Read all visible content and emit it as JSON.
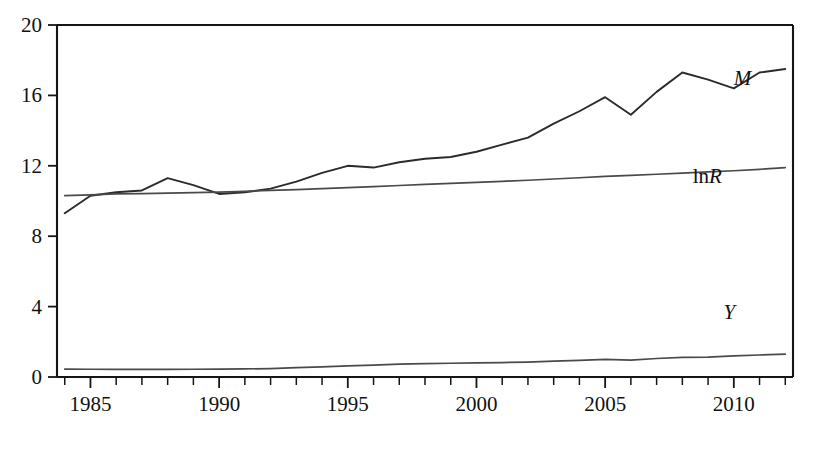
{
  "chart_data": {
    "type": "line",
    "title": "",
    "subtitle": "",
    "xlabel": "",
    "ylabel": "",
    "xlim": [
      1983.7,
      2012.3
    ],
    "ylim": [
      0,
      20
    ],
    "grid": false,
    "legend_position": "inline-right",
    "y_ticks": [
      0,
      4,
      8,
      12,
      16,
      20
    ],
    "y_tick_labels": [
      "0",
      "4",
      "8",
      "12",
      "16",
      "20"
    ],
    "x_ticks": [
      1985,
      1990,
      1995,
      2000,
      2005,
      2010
    ],
    "x_tick_labels": [
      "1985",
      "1990",
      "1995",
      "2000",
      "2005",
      "2010"
    ],
    "x_minor_tick_interval": 1,
    "x": [
      1984,
      1985,
      1986,
      1987,
      1988,
      1989,
      1990,
      1991,
      1992,
      1993,
      1994,
      1995,
      1996,
      1997,
      1998,
      1999,
      2000,
      2001,
      2002,
      2003,
      2004,
      2005,
      2006,
      2007,
      2008,
      2009,
      2010,
      2011,
      2012
    ],
    "series": [
      {
        "name": "M",
        "label": "M",
        "label_style": "italic",
        "color": "#2b2b2b",
        "values": [
          9.3,
          10.3,
          10.5,
          10.6,
          11.3,
          10.9,
          10.4,
          10.5,
          10.7,
          11.1,
          11.6,
          12.0,
          11.9,
          12.2,
          12.4,
          12.5,
          12.8,
          13.2,
          13.6,
          14.4,
          15.1,
          15.9,
          14.9,
          16.2,
          17.3,
          16.9,
          16.4,
          17.3,
          17.5
        ]
      },
      {
        "name": "lnR",
        "label": "lnR",
        "label_style": "mixed",
        "color": "#4a4a4a",
        "values": [
          10.3,
          10.35,
          10.4,
          10.42,
          10.45,
          10.48,
          10.5,
          10.55,
          10.6,
          10.65,
          10.7,
          10.76,
          10.82,
          10.88,
          10.94,
          11.0,
          11.06,
          11.12,
          11.18,
          11.25,
          11.32,
          11.4,
          11.46,
          11.52,
          11.58,
          11.65,
          11.72,
          11.8,
          11.9
        ]
      },
      {
        "name": "Y",
        "label": "Y",
        "label_style": "italic",
        "color": "#4a4a4a",
        "values": [
          0.45,
          0.44,
          0.43,
          0.43,
          0.43,
          0.44,
          0.45,
          0.46,
          0.48,
          0.53,
          0.58,
          0.63,
          0.68,
          0.73,
          0.76,
          0.78,
          0.8,
          0.82,
          0.85,
          0.9,
          0.95,
          1.0,
          0.96,
          1.05,
          1.12,
          1.13,
          1.2,
          1.25,
          1.3
        ]
      }
    ],
    "annotations": [
      {
        "text": "M",
        "x": 2010.0,
        "y": 16.6,
        "style": "italic"
      },
      {
        "text": "lnR",
        "x": 2008.4,
        "y": 11.05,
        "style": "mixed"
      },
      {
        "text": "Y",
        "x": 2009.6,
        "y": 3.3,
        "style": "italic"
      }
    ]
  },
  "caption": {
    "text": ""
  }
}
